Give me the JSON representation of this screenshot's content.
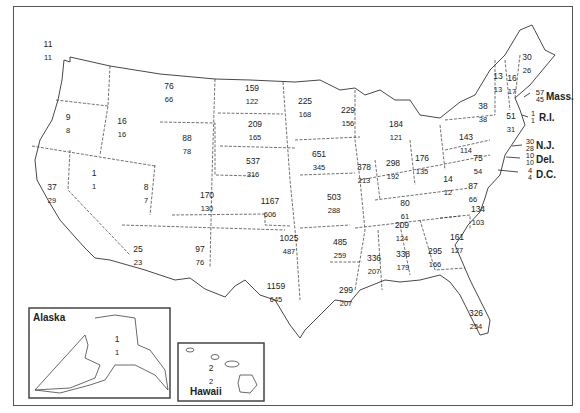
{
  "map": {
    "type": "choropleth-labels",
    "description": "US state map with two numbers per state (upper value / lower value)",
    "states": [
      {
        "name": "Washington",
        "upper": "11",
        "lower": "11",
        "x": 48,
        "y": 44
      },
      {
        "name": "Oregon",
        "upper": "9",
        "lower": "8",
        "x": 68,
        "y": 117
      },
      {
        "name": "California",
        "upper": "37",
        "lower": "29",
        "x": 52,
        "y": 187
      },
      {
        "name": "Idaho",
        "upper": "16",
        "lower": "16",
        "x": 122,
        "y": 121
      },
      {
        "name": "Nevada",
        "upper": "1",
        "lower": "1",
        "x": 94,
        "y": 173
      },
      {
        "name": "Montana",
        "upper": "76",
        "lower": "66",
        "x": 169,
        "y": 86
      },
      {
        "name": "Wyoming",
        "upper": "88",
        "lower": "78",
        "x": 187,
        "y": 138
      },
      {
        "name": "Utah",
        "upper": "8",
        "lower": "7",
        "x": 146,
        "y": 187
      },
      {
        "name": "Colorado",
        "upper": "170",
        "lower": "130",
        "x": 207,
        "y": 195
      },
      {
        "name": "Arizona",
        "upper": "25",
        "lower": "23",
        "x": 138,
        "y": 249
      },
      {
        "name": "New Mexico",
        "upper": "97",
        "lower": "76",
        "x": 200,
        "y": 249
      },
      {
        "name": "North Dakota",
        "upper": "159",
        "lower": "122",
        "x": 252,
        "y": 88
      },
      {
        "name": "South Dakota",
        "upper": "209",
        "lower": "165",
        "x": 255,
        "y": 124
      },
      {
        "name": "Nebraska",
        "upper": "537",
        "lower": "316",
        "x": 253,
        "y": 161
      },
      {
        "name": "Kansas",
        "upper": "1167",
        "lower": "606",
        "x": 270,
        "y": 201
      },
      {
        "name": "Oklahoma",
        "upper": "1025",
        "lower": "487",
        "x": 289,
        "y": 238
      },
      {
        "name": "Texas",
        "upper": "1159",
        "lower": "645",
        "x": 276,
        "y": 286
      },
      {
        "name": "Minnesota",
        "upper": "225",
        "lower": "168",
        "x": 305,
        "y": 101
      },
      {
        "name": "Iowa",
        "upper": "651",
        "lower": "345",
        "x": 319,
        "y": 154
      },
      {
        "name": "Missouri",
        "upper": "503",
        "lower": "288",
        "x": 334,
        "y": 197
      },
      {
        "name": "Arkansas",
        "upper": "485",
        "lower": "259",
        "x": 340,
        "y": 242
      },
      {
        "name": "Louisiana",
        "upper": "299",
        "lower": "207",
        "x": 346,
        "y": 290
      },
      {
        "name": "Wisconsin",
        "upper": "229",
        "lower": "156",
        "x": 348,
        "y": 110
      },
      {
        "name": "Illinois",
        "upper": "378",
        "lower": "213",
        "x": 364,
        "y": 167
      },
      {
        "name": "Michigan",
        "upper": "184",
        "lower": "121",
        "x": 396,
        "y": 124
      },
      {
        "name": "Indiana",
        "upper": "298",
        "lower": "192",
        "x": 393,
        "y": 163
      },
      {
        "name": "Ohio",
        "upper": "176",
        "lower": "135",
        "x": 422,
        "y": 158
      },
      {
        "name": "Kentucky",
        "upper": "80",
        "lower": "61",
        "x": 405,
        "y": 203
      },
      {
        "name": "Tennessee",
        "upper": "209",
        "lower": "124",
        "x": 402,
        "y": 225
      },
      {
        "name": "Mississippi",
        "upper": "336",
        "lower": "207",
        "x": 374,
        "y": 258
      },
      {
        "name": "Alabama",
        "upper": "338",
        "lower": "179",
        "x": 403,
        "y": 254
      },
      {
        "name": "Georgia",
        "upper": "295",
        "lower": "166",
        "x": 435,
        "y": 251
      },
      {
        "name": "Florida",
        "upper": "326",
        "lower": "254",
        "x": 476,
        "y": 313
      },
      {
        "name": "South Carolina",
        "upper": "161",
        "lower": "127",
        "x": 457,
        "y": 237
      },
      {
        "name": "North Carolina",
        "upper": "134",
        "lower": "103",
        "x": 478,
        "y": 209
      },
      {
        "name": "Virginia",
        "upper": "87",
        "lower": "66",
        "x": 473,
        "y": 186
      },
      {
        "name": "West Virginia",
        "upper": "14",
        "lower": "12",
        "x": 448,
        "y": 179
      },
      {
        "name": "Pennsylvania",
        "upper": "143",
        "lower": "114",
        "x": 466,
        "y": 137
      },
      {
        "name": "New York",
        "upper": "38",
        "lower": "38",
        "x": 483,
        "y": 106
      },
      {
        "name": "Vermont",
        "upper": "13",
        "lower": "13",
        "x": 498,
        "y": 76
      },
      {
        "name": "New Hampshire",
        "upper": "16",
        "lower": "17",
        "x": 512,
        "y": 78
      },
      {
        "name": "Maine",
        "upper": "30",
        "lower": "26",
        "x": 527,
        "y": 57
      },
      {
        "name": "Maryland",
        "upper": "75",
        "lower": "54",
        "x": 478,
        "y": 158
      },
      {
        "name": "Connecticut",
        "upper": "51",
        "lower": "31",
        "x": 511,
        "y": 116
      }
    ],
    "callouts": [
      {
        "name": "Massachusetts",
        "abbr": "Mass.",
        "upper": "57",
        "lower": "45",
        "x": 540,
        "y": 97
      },
      {
        "name": "Rhode Island",
        "abbr": "R.I.",
        "upper": "1",
        "lower": "1",
        "x": 533,
        "y": 118
      },
      {
        "name": "New Jersey",
        "abbr": "N.J.",
        "upper": "30",
        "lower": "28",
        "x": 530,
        "y": 146
      },
      {
        "name": "Delaware",
        "abbr": "Del.",
        "upper": "10",
        "lower": "10",
        "x": 530,
        "y": 160
      },
      {
        "name": "District of Columbia",
        "abbr": "D.C.",
        "upper": "4",
        "lower": "4",
        "x": 530,
        "y": 175
      }
    ],
    "insets": {
      "alaska": {
        "title": "Alaska",
        "upper": "1",
        "lower": "1"
      },
      "hawaii": {
        "title": "Hawaii",
        "upper": "2",
        "lower": "2"
      }
    }
  }
}
